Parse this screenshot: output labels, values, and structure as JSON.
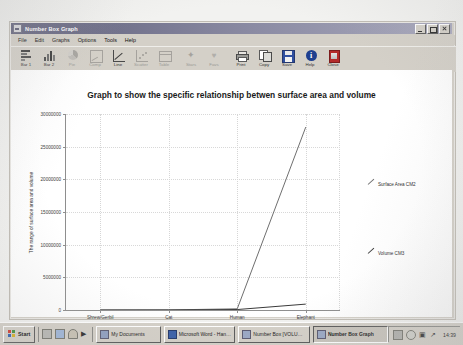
{
  "window": {
    "title": "Number Box Graph",
    "icon": "chart-window-icon",
    "controls": {
      "minimize": "Minimize",
      "maximize": "Maximize",
      "close": "Close"
    }
  },
  "menu": {
    "items": [
      {
        "label": "File"
      },
      {
        "label": "Edit"
      },
      {
        "label": "Graphs"
      },
      {
        "label": "Options"
      },
      {
        "label": "Tools"
      },
      {
        "label": "Help"
      }
    ]
  },
  "toolbar": {
    "buttons": [
      {
        "label": "Bar 1",
        "icon": "bar-chart-horizontal-icon",
        "enabled": true
      },
      {
        "label": "Bar 2",
        "icon": "bar-chart-vertical-icon",
        "enabled": true
      },
      {
        "label": "Pie",
        "icon": "pie-chart-icon",
        "enabled": false
      },
      {
        "label": "Comp",
        "icon": "compare-chart-icon",
        "enabled": false
      },
      {
        "label": "Line",
        "icon": "line-chart-icon",
        "enabled": true
      },
      {
        "label": "Scatter",
        "icon": "scatter-plot-icon",
        "enabled": false
      },
      {
        "label": "Table",
        "icon": "table-icon",
        "enabled": false
      },
      {
        "label": "Stars",
        "icon": "star-icon",
        "enabled": false
      },
      {
        "label": "Favs",
        "icon": "heart-icon",
        "enabled": false
      },
      {
        "label": "Print",
        "icon": "printer-icon",
        "enabled": true
      },
      {
        "label": "Copy",
        "icon": "copy-pages-icon",
        "enabled": true
      },
      {
        "label": "Save",
        "icon": "floppy-disk-icon",
        "enabled": true
      },
      {
        "label": "Help",
        "icon": "info-circle-icon",
        "enabled": true
      },
      {
        "label": "Close",
        "icon": "door-exit-icon",
        "enabled": true
      }
    ]
  },
  "chart_data": {
    "type": "line",
    "title": "Graph to show the specific relationship betwen surface area and volume",
    "xlabel": "Animal",
    "ylabel": "The range of surface area and volume",
    "categories": [
      "Shrew/Gerbil",
      "Cat",
      "Human",
      "Elephant"
    ],
    "ylim": [
      0,
      30000000
    ],
    "yticks": [
      0,
      5000000,
      10000000,
      15000000,
      20000000,
      25000000,
      30000000
    ],
    "ytick_labels": [
      "0",
      "5000000",
      "10000000",
      "15000000",
      "20000000",
      "25000000",
      "30000000"
    ],
    "grid": true,
    "legend_position": "right",
    "series": [
      {
        "name": "Surface Area CM2",
        "color": "#6f6f6f",
        "values": [
          1200,
          14000,
          180000,
          28000000
        ]
      },
      {
        "name": "Volume CM3",
        "color": "#3a3a3a",
        "values": [
          200,
          4000,
          70000,
          900000
        ]
      }
    ]
  },
  "taskbar": {
    "start_label": "Start",
    "quicklaunch": [
      {
        "icon": "show-desktop-icon"
      },
      {
        "icon": "internet-explorer-icon"
      },
      {
        "icon": "outlook-mail-icon"
      },
      {
        "icon": "media-player-icon"
      }
    ],
    "tasks": [
      {
        "label": "My Documents",
        "icon": "folder-icon",
        "active": false
      },
      {
        "label": "Microsoft Word - Handling",
        "icon": "word-icon",
        "active": false
      },
      {
        "label": "Number Box [VOLUME1 N...",
        "icon": "number-box-icon",
        "active": false
      },
      {
        "label": "Number Box Graph",
        "icon": "number-box-graph-icon",
        "active": true
      }
    ],
    "tray": [
      {
        "icon": "network-icon"
      },
      {
        "icon": "volume-icon"
      },
      {
        "icon": "printer-tray-icon"
      },
      {
        "icon": "keyboard-layout-icon"
      }
    ],
    "clock": "14:39"
  }
}
